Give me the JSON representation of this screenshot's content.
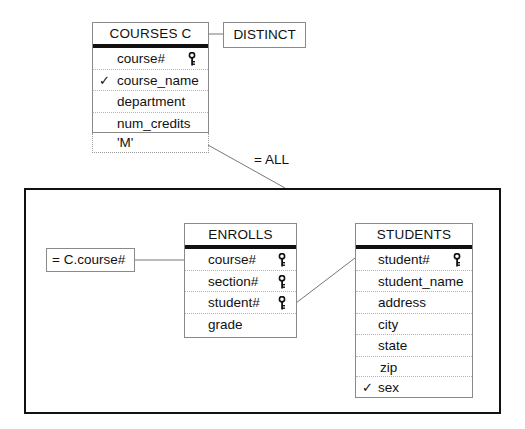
{
  "diagram": {
    "type": "query-by-example",
    "outer_query": {
      "table": {
        "name": "COURSES C",
        "columns": [
          {
            "label": "course#",
            "key": true,
            "checked": false
          },
          {
            "label": "course_name",
            "key": false,
            "checked": true
          },
          {
            "label": "department",
            "key": false,
            "checked": false
          },
          {
            "label": "num_credits",
            "key": false,
            "checked": false
          }
        ],
        "condition_cell": "'M'"
      },
      "modifier": "DISTINCT",
      "subquery_link_label": "= ALL"
    },
    "subquery": {
      "condition": "= C.course#",
      "tables": [
        {
          "name": "ENROLLS",
          "columns": [
            {
              "label": "course#",
              "key": true,
              "checked": false
            },
            {
              "label": "section#",
              "key": true,
              "checked": false
            },
            {
              "label": "student#",
              "key": true,
              "checked": false
            },
            {
              "label": "grade",
              "key": false,
              "checked": false
            }
          ]
        },
        {
          "name": "STUDENTS",
          "columns": [
            {
              "label": "student#",
              "key": true,
              "checked": false
            },
            {
              "label": "student_name",
              "key": false,
              "checked": false
            },
            {
              "label": "address",
              "key": false,
              "checked": false
            },
            {
              "label": "city",
              "key": false,
              "checked": false
            },
            {
              "label": "state",
              "key": false,
              "checked": false
            },
            {
              "label": "zip",
              "key": false,
              "checked": false
            },
            {
              "label": "sex",
              "key": false,
              "checked": true
            }
          ]
        }
      ]
    },
    "check_glyph": "✓",
    "icons": {
      "key": "key-icon",
      "check": "checkmark-icon"
    }
  }
}
